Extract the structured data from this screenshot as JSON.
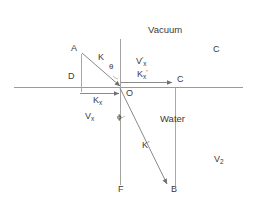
{
  "figure": {
    "type": "optics-refraction-diagram",
    "stroke_color": "#8a8a8a",
    "text_color": "#3a3a3a",
    "background": "#ffffff"
  },
  "media": {
    "upper_label": "Vacuum",
    "lower_label": "Water"
  },
  "points": {
    "a": "A",
    "b": "B",
    "c": "C",
    "d": "D",
    "f": "F",
    "o": "O",
    "c_far": "C"
  },
  "vectors": {
    "incident": "K",
    "refracted_main": "K",
    "refracted_prime": "'",
    "k_x": "K",
    "k_x_sub": "x",
    "v_x": "V",
    "v_x_sub": "x",
    "k_x_prime": "K",
    "k_x_prime_sub": "x",
    "k_x_prime_mark": "'",
    "v_x_prime": "V",
    "v_x_prime_mark": "'",
    "v_x_prime_sub": "x"
  },
  "angles": {
    "theta": "θ",
    "phi": "ϕ"
  },
  "right_labels": {
    "v2_base": "V",
    "v2_sub": "2"
  },
  "geometry": {
    "origin": [
      120,
      87
    ],
    "point_a": [
      81,
      52
    ],
    "point_d": [
      81,
      87
    ],
    "point_c": [
      175,
      87
    ],
    "point_b": [
      168,
      186
    ],
    "point_f": [
      120,
      186
    ],
    "interface_y": 87,
    "normal_x": 120
  }
}
